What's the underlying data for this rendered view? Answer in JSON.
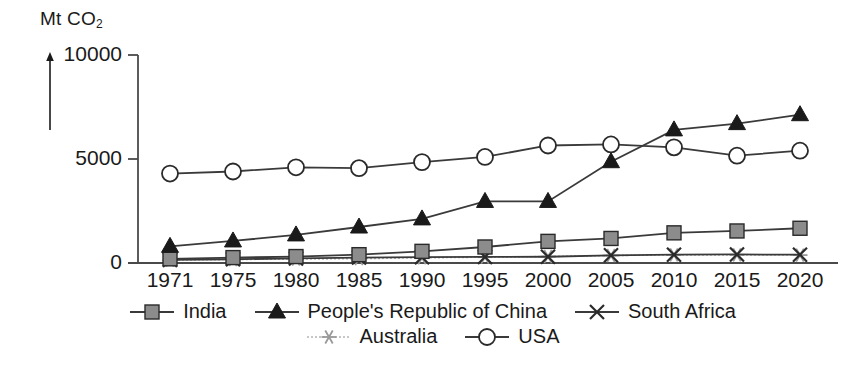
{
  "chart_data": {
    "type": "line",
    "title": "",
    "subtitle": "",
    "ylabel": "Mt CO2",
    "ylabel_text": "Mt CO",
    "ylabel_sub": "2",
    "xlabel": "",
    "ylim": [
      0,
      10000
    ],
    "yticks": [
      0,
      5000,
      10000
    ],
    "ytick_labels": [
      "0",
      "5000",
      "10000"
    ],
    "grid": false,
    "legend_position": "bottom",
    "categories": [
      "1971",
      "1975",
      "1980",
      "1985",
      "1990",
      "1995",
      "2000",
      "2005",
      "2010",
      "2015",
      "2020"
    ],
    "x": [
      1971,
      1975,
      1980,
      1985,
      1990,
      1995,
      2000,
      2005,
      2010,
      2015,
      2020
    ],
    "series": [
      {
        "name": "India",
        "marker": "square",
        "color": "#8c8c8c",
        "line_color": "#3a3a3a",
        "values": [
          200,
          260,
          310,
          400,
          560,
          770,
          1040,
          1180,
          1450,
          1540,
          1670
        ]
      },
      {
        "name": "People's Republic of China",
        "marker": "triangle",
        "color": "#1a1a1a",
        "line_color": "#3a3a3a",
        "values": [
          800,
          1060,
          1350,
          1730,
          2120,
          2960,
          2960,
          4870,
          6400,
          6700,
          7130
        ]
      },
      {
        "name": "South Africa",
        "marker": "cross",
        "color": "#2a2a2a",
        "line_color": "#3a3a3a",
        "values": [
          150,
          180,
          220,
          260,
          280,
          290,
          300,
          370,
          400,
          410,
          400
        ]
      },
      {
        "name": "Australia",
        "marker": "asterisk",
        "color": "#9a9a9a",
        "line_color": "#b5b5b5",
        "values": [
          140,
          170,
          190,
          210,
          250,
          280,
          310,
          360,
          390,
          390,
          380
        ]
      },
      {
        "name": "USA",
        "marker": "circle",
        "color": "#ffffff",
        "line_color": "#3a3a3a",
        "values": [
          4300,
          4400,
          4600,
          4560,
          4850,
          5100,
          5650,
          5700,
          5560,
          5160,
          5400
        ]
      }
    ]
  },
  "legend": {
    "rows": [
      [
        {
          "label": "India",
          "marker": "square"
        },
        {
          "label": "People's Republic of China",
          "marker": "triangle"
        },
        {
          "label": "South Africa",
          "marker": "cross"
        }
      ],
      [
        {
          "label": "Australia",
          "marker": "asterisk"
        },
        {
          "label": "USA",
          "marker": "circle"
        }
      ]
    ]
  }
}
